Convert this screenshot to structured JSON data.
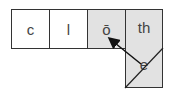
{
  "diagram": {
    "tiles": [
      {
        "label": "c",
        "shaded": false
      },
      {
        "label": "l",
        "shaded": false
      },
      {
        "label": "ō",
        "shaded": true
      },
      {
        "label": "th",
        "shaded": true
      }
    ],
    "lower_tile": {
      "label": "e",
      "shaded": true,
      "crossed": true
    },
    "arrow": {
      "from": "e",
      "to": "ō"
    },
    "colors": {
      "shade": "#e2e2e2",
      "line": "#333333",
      "text": "#444444"
    }
  }
}
